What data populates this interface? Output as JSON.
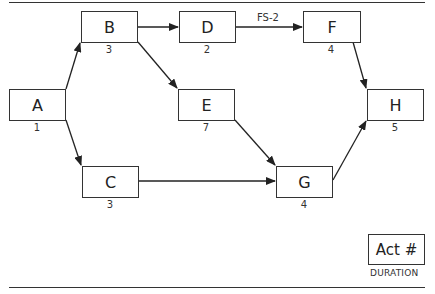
{
  "diagram": {
    "type": "precedence-network",
    "nodes": [
      {
        "id": "A",
        "label": "A",
        "duration": "1"
      },
      {
        "id": "B",
        "label": "B",
        "duration": "3"
      },
      {
        "id": "C",
        "label": "C",
        "duration": "3"
      },
      {
        "id": "D",
        "label": "D",
        "duration": "2"
      },
      {
        "id": "E",
        "label": "E",
        "duration": "7"
      },
      {
        "id": "F",
        "label": "F",
        "duration": "4"
      },
      {
        "id": "G",
        "label": "G",
        "duration": "4"
      },
      {
        "id": "H",
        "label": "H",
        "duration": "5"
      }
    ],
    "edges": [
      {
        "from": "A",
        "to": "B"
      },
      {
        "from": "A",
        "to": "C"
      },
      {
        "from": "B",
        "to": "D"
      },
      {
        "from": "B",
        "to": "E"
      },
      {
        "from": "D",
        "to": "F",
        "label": "FS-2"
      },
      {
        "from": "E",
        "to": "G"
      },
      {
        "from": "C",
        "to": "G"
      },
      {
        "from": "F",
        "to": "H"
      },
      {
        "from": "G",
        "to": "H"
      }
    ],
    "edge_label_DF": "FS-2",
    "legend": {
      "box_label": "Act #",
      "sub_label": "DURATION"
    }
  }
}
